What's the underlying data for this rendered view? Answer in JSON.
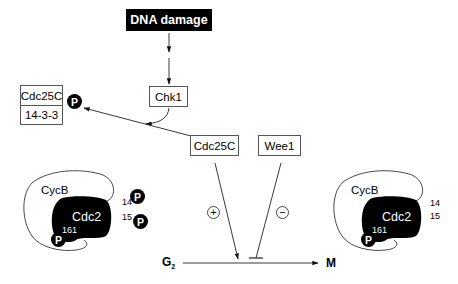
{
  "diagram": {
    "trigger": {
      "label": "DNA damage"
    },
    "kinase": {
      "label": "Chk1"
    },
    "sequestered_complex": {
      "top_label": "Cdc25C",
      "bottom_label": "14-3-3",
      "phospho_label": "P"
    },
    "activator": {
      "label": "Cdc25C",
      "effect_symbol": "+"
    },
    "inhibitor": {
      "label": "Wee1",
      "effect_symbol": "−"
    },
    "transition": {
      "from_label": "G",
      "from_subscript": "2",
      "to_label": "M"
    },
    "left_complex": {
      "cyclin_label": "CycB",
      "cdk_label": "Cdc2",
      "site_161": "161",
      "site_14": "14",
      "site_15": "15",
      "p161_label": "P",
      "p14_label": "P",
      "p15_label": "P"
    },
    "right_complex": {
      "cyclin_label": "CycB",
      "cdk_label": "Cdc2",
      "site_161": "161",
      "site_14": "14",
      "site_15": "15",
      "p161_label": "P"
    },
    "colors": {
      "fill_dark": "#000000",
      "stroke": "#333333",
      "background": "#ffffff"
    }
  }
}
